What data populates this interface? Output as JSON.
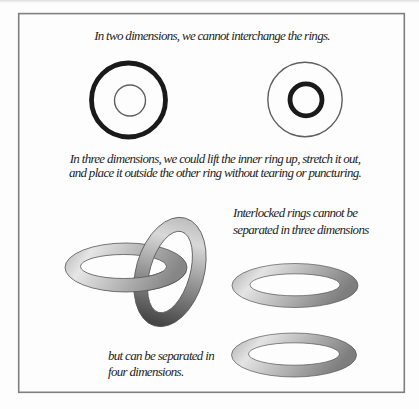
{
  "figure": {
    "captions": {
      "two_d": "In two dimensions, we cannot interchange the rings.",
      "three_d_line1": "In three dimensions, we could lift the inner ring up, stretch it out,",
      "three_d_line2": "and place it outside the other ring without tearing or puncturing.",
      "interlocked_line1": "Interlocked rings cannot be",
      "interlocked_line2": "separated in three dimensions",
      "separated_line1": "but can be separated in",
      "separated_line2": "four dimensions."
    },
    "colors": {
      "background": "#fdfdfd",
      "frame": "#7f7f7f",
      "text": "#1e1e1e",
      "ink": "#1a1a1a",
      "thin_line": "#5f5f5f",
      "ring_outline": "#555555"
    },
    "gradients": {
      "horizontal_ring": [
        "#b0b0b0",
        "#e6e6e6",
        "#868686"
      ],
      "tilted_ring": [
        "#bdbdbd",
        "#d8d8d8",
        "#8f8f8f",
        "#404040"
      ],
      "separated_ring": [
        "#a8a8a8",
        "#e4e4e4",
        "#7e7e7e"
      ]
    }
  }
}
